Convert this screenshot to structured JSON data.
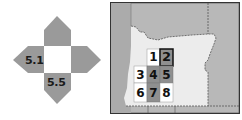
{
  "compass": {
    "labels": {
      "west": "5.1",
      "south": "5.5"
    },
    "colors": {
      "arm": "#9a9a9a",
      "center": "#ffffff"
    }
  },
  "locator_map": {
    "colors": {
      "outside": "#b8b8b8",
      "state": "#e9e9e9",
      "highlight_dark": "#8f8f8f",
      "highlight_light": "#ffffff",
      "border": "#333333"
    },
    "grid_cells": [
      {
        "id": "1",
        "label": "1",
        "shade": "light"
      },
      {
        "id": "2",
        "label": "2",
        "shade": "dark",
        "selected": true
      },
      {
        "id": "3",
        "label": "3",
        "shade": "light"
      },
      {
        "id": "4",
        "label": "4",
        "shade": "dark"
      },
      {
        "id": "5",
        "label": "5",
        "shade": "dark"
      },
      {
        "id": "6",
        "label": "6",
        "shade": "light"
      },
      {
        "id": "7",
        "label": "7",
        "shade": "dark"
      },
      {
        "id": "8",
        "label": "8",
        "shade": "light"
      }
    ]
  }
}
